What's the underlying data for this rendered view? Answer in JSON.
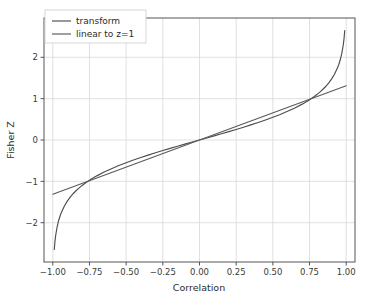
{
  "chart_data": {
    "type": "line",
    "title": "",
    "xlabel": "Correlation",
    "ylabel": "Fisher Z",
    "xlim": [
      -1.06,
      1.06
    ],
    "ylim": [
      -2.95,
      2.95
    ],
    "xticks": [
      -1.0,
      -0.75,
      -0.5,
      -0.25,
      0.0,
      0.25,
      0.5,
      0.75,
      1.0
    ],
    "xticklabels": [
      "-1.00",
      "-0.75",
      "-0.50",
      "-0.25",
      "0.00",
      "0.25",
      "0.50",
      "0.75",
      "1.00"
    ],
    "yticks": [
      -2,
      -1,
      0,
      1,
      2
    ],
    "yticklabels": [
      "-2",
      "-1",
      "0",
      "1",
      "2"
    ],
    "grid": true,
    "grid_color": "#d8d8d8",
    "background": "#ffffff",
    "frame_color": "#555555",
    "legend_position": "upper left",
    "series": [
      {
        "name": "transform",
        "color": "#4d4d4d",
        "x": [
          -0.99,
          -0.985,
          -0.98,
          -0.97,
          -0.96,
          -0.95,
          -0.94,
          -0.92,
          -0.9,
          -0.88,
          -0.86,
          -0.84,
          -0.82,
          -0.8,
          -0.78,
          -0.76,
          -0.74,
          -0.72,
          -0.7,
          -0.65,
          -0.6,
          -0.55,
          -0.5,
          -0.45,
          -0.4,
          -0.35,
          -0.3,
          -0.25,
          -0.2,
          -0.15,
          -0.1,
          -0.05,
          0.0,
          0.05,
          0.1,
          0.15,
          0.2,
          0.25,
          0.3,
          0.35,
          0.4,
          0.45,
          0.5,
          0.55,
          0.6,
          0.65,
          0.7,
          0.72,
          0.74,
          0.76,
          0.78,
          0.8,
          0.82,
          0.84,
          0.86,
          0.88,
          0.9,
          0.92,
          0.94,
          0.95,
          0.96,
          0.97,
          0.98,
          0.985,
          0.99
        ],
        "y": [
          -2.6467,
          -2.4426,
          -2.2976,
          -2.0923,
          -1.9459,
          -1.8318,
          -1.738,
          -1.589,
          -1.4722,
          -1.3758,
          -1.2933,
          -1.2212,
          -1.1568,
          -1.0986,
          -1.0454,
          -0.9962,
          -0.9505,
          -0.9076,
          -0.8673,
          -0.7753,
          -0.6931,
          -0.6184,
          -0.5493,
          -0.4847,
          -0.4236,
          -0.3654,
          -0.3095,
          -0.2554,
          -0.2027,
          -0.1511,
          -0.1003,
          -0.05,
          0.0,
          0.05,
          0.1003,
          0.1511,
          0.2027,
          0.2554,
          0.3095,
          0.3654,
          0.4236,
          0.4847,
          0.5493,
          0.6184,
          0.6931,
          0.7753,
          0.8673,
          0.9076,
          0.9505,
          0.9962,
          1.0454,
          1.0986,
          1.1568,
          1.2212,
          1.2933,
          1.3758,
          1.4722,
          1.589,
          1.738,
          1.8318,
          1.9459,
          2.0923,
          2.2976,
          2.4426,
          2.6467
        ]
      },
      {
        "name": "linear to z=1",
        "color": "#5a5a5a",
        "x": [
          -1.0,
          1.0
        ],
        "y": [
          -1.3124,
          1.3124
        ]
      }
    ],
    "legend_entries": [
      {
        "label": "transform",
        "color": "#4d4d4d"
      },
      {
        "label": "linear to z=1",
        "color": "#5a5a5a"
      }
    ]
  }
}
